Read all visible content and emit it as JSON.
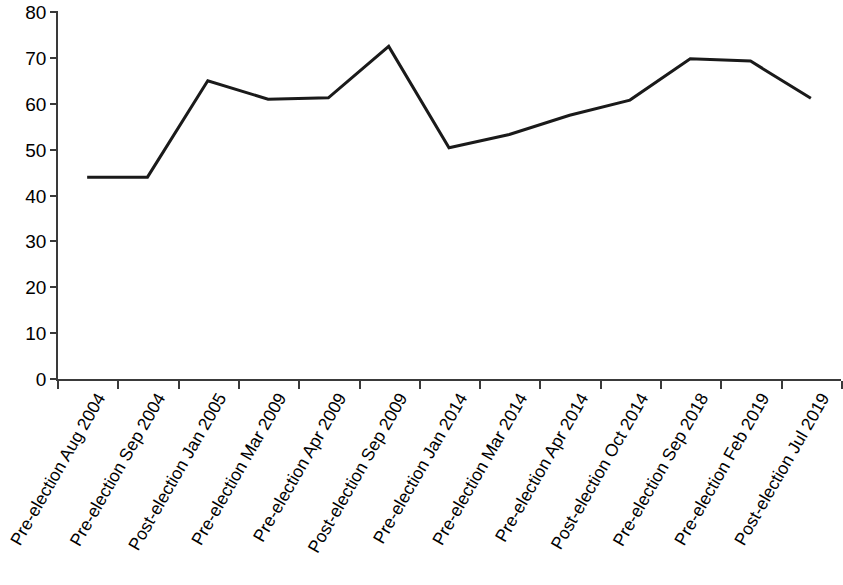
{
  "chart_data": {
    "type": "line",
    "title": "",
    "subtitle": "",
    "xlabel": "",
    "ylabel": "",
    "ylim": [
      0,
      80
    ],
    "y_ticks": [
      0,
      10,
      20,
      30,
      40,
      50,
      60,
      70,
      80
    ],
    "grid": false,
    "legend": "none",
    "line_color": "#1a1a1a",
    "line_width": 3,
    "categories": [
      "Pre-election Aug 2004",
      "Pre-election Sep 2004",
      "Post-election Jan 2005",
      "Pre-election Mar 2009",
      "Pre-election Apr 2009",
      "Post-election Sep 2009",
      "Pre-election Jan 2014",
      "Pre-election Mar 2014",
      "Pre-election Apr 2014",
      "Post-election Oct 2014",
      "Pre-election Sep 2018",
      "Pre-election Feb 2019",
      "Post-election Jul 2019"
    ],
    "values": [
      44,
      44,
      65,
      61,
      61.3,
      72.5,
      50.4,
      53.3,
      57.5,
      60.8,
      69.8,
      69.3,
      61.2
    ],
    "series": [
      {
        "name": "",
        "values": [
          44,
          44,
          65,
          61,
          61.3,
          72.5,
          50.4,
          53.3,
          57.5,
          60.8,
          69.8,
          69.3,
          61.2
        ]
      }
    ]
  }
}
